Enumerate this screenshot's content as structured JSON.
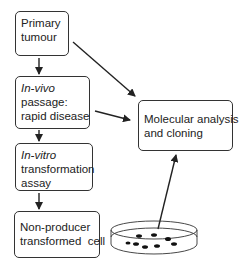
{
  "diagram": {
    "nodes": [
      {
        "id": "primary",
        "lines": [
          "Primary",
          "tumour"
        ],
        "italic_first": false
      },
      {
        "id": "invivo",
        "lines": [
          "In-vivo",
          "passage:",
          "rapid disease"
        ],
        "italic_first": true
      },
      {
        "id": "invitro",
        "lines": [
          "In-vitro",
          "transformation",
          "assay"
        ],
        "italic_first": true
      },
      {
        "id": "nonproducer",
        "lines": [
          "Non-producer",
          "transformed  cell"
        ],
        "italic_first": false
      },
      {
        "id": "molecular",
        "lines": [
          "Molecular analysis",
          "and cloning"
        ],
        "italic_first": false
      }
    ],
    "edges": [
      {
        "from": "primary",
        "to": "invivo"
      },
      {
        "from": "invivo",
        "to": "invitro"
      },
      {
        "from": "invitro",
        "to": "nonproducer"
      },
      {
        "from": "primary",
        "to": "molecular"
      },
      {
        "from": "invivo",
        "to": "molecular"
      },
      {
        "from": "petri-dish",
        "to": "molecular"
      }
    ],
    "petri_dish": {
      "label": "petri dish with transformed colonies",
      "colony_count": 8
    },
    "colors": {
      "stroke": "#222222",
      "fill": "#ffffff"
    }
  }
}
